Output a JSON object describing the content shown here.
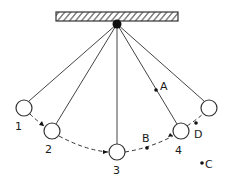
{
  "diagram": {
    "colors": {
      "stroke": "#333333",
      "fill_ball": "#ffffff",
      "dot": "#111111",
      "background": "#ffffff"
    },
    "support": {
      "label": "ceiling"
    },
    "pivot": {
      "label": "pivot"
    },
    "positions": [
      {
        "id": "1",
        "label": "1"
      },
      {
        "id": "2",
        "label": "2"
      },
      {
        "id": "3",
        "label": "3"
      },
      {
        "id": "4",
        "label": "4"
      },
      {
        "id": "5",
        "label": ""
      }
    ],
    "points": [
      {
        "id": "A",
        "label": "A"
      },
      {
        "id": "B",
        "label": "B"
      },
      {
        "id": "C",
        "label": "C"
      },
      {
        "id": "D",
        "label": "D"
      }
    ]
  }
}
